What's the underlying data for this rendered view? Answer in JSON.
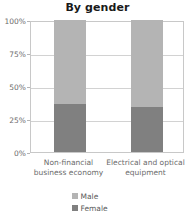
{
  "chart_data": {
    "type": "bar",
    "subtype": "stacked-percentage",
    "title": "By gender",
    "xlabel": "",
    "ylabel": "",
    "ylim": [
      0,
      100
    ],
    "yticks": [
      "0%",
      "25%",
      "50%",
      "75%",
      "100%"
    ],
    "ytick_values": [
      0,
      25,
      50,
      75,
      100
    ],
    "grid": true,
    "legend_position": "bottom",
    "categories": [
      "Non-financial business economy",
      "Electrical and optical equipment"
    ],
    "category_lines": [
      [
        "Non-financial",
        "business economy"
      ],
      [
        "Electrical and optical",
        "equipment"
      ]
    ],
    "series": [
      {
        "name": "Male",
        "color": "#b4b4b4",
        "values": [
          64,
          66
        ]
      },
      {
        "name": "Female",
        "color": "#808080",
        "values": [
          36,
          34
        ]
      }
    ],
    "colors": {
      "male": "#b4b4b4",
      "female": "#808080",
      "gridline": "#d2d2d2",
      "axis": "#c8c8c8",
      "title_text": "#1a1a1a",
      "label_text": "#6b6b6b"
    }
  },
  "legend": {
    "items": [
      {
        "label": "Male",
        "color": "#b4b4b4"
      },
      {
        "label": "Female",
        "color": "#808080"
      }
    ]
  }
}
